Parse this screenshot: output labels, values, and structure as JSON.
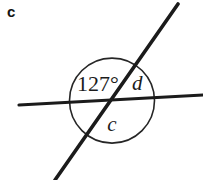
{
  "figure": {
    "part_label": "c",
    "canvas": {
      "width": 203,
      "height": 180,
      "background": "#ffffff"
    },
    "stroke_color": "#1b1b1b",
    "arc_color": "#262626",
    "lines": [
      {
        "name": "horizontal-transversal",
        "x1": 19,
        "y1": 105,
        "x2": 203,
        "y2": 95,
        "width": 3.2
      },
      {
        "name": "diagonal-transversal",
        "x1": 178,
        "y1": 4,
        "x2": 55,
        "y2": 180,
        "width": 3.6
      }
    ],
    "intersection": {
      "x": 112,
      "y": 100.6
    },
    "angle_arc": {
      "name": "angle-circle",
      "cx": 112,
      "cy": 100.6,
      "r": 42.5,
      "width": 1.6
    },
    "labels": [
      {
        "name": "angle-measure-127",
        "text": "127°",
        "x": 77,
        "y": 91,
        "style": "measure"
      },
      {
        "name": "angle-label-d",
        "text": "d",
        "x": 132,
        "y": 90,
        "style": "variable"
      },
      {
        "name": "angle-label-c",
        "text": "c",
        "x": 112,
        "y": 131,
        "style": "variable"
      }
    ]
  }
}
